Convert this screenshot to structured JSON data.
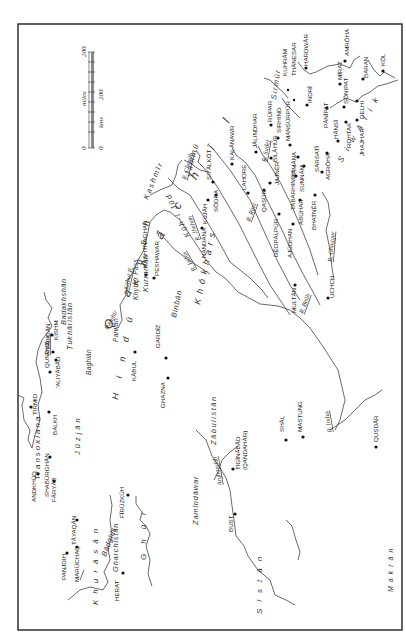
{
  "map": {
    "orientation": "rotated 90deg counter-clockwise (north to the left)",
    "scale_bar": {
      "miles_label": "miles",
      "kms_label": "kms",
      "miles_min": "0",
      "miles_max": "200",
      "kms_min": "0",
      "kms_max": "200"
    },
    "regions": [
      {
        "name": "Transoxiana"
      },
      {
        "name": "Badakhshān"
      },
      {
        "name": "Ṭukhāristān"
      },
      {
        "name": "Baghlān"
      },
      {
        "name": "Parwān"
      },
      {
        "name": "Panjhīr"
      },
      {
        "name": "Jūzjān"
      },
      {
        "name": "Khurāsān"
      },
      {
        "name": "Bādghīs"
      },
      {
        "name": "Gharchistān"
      },
      {
        "name": "Ghūr"
      },
      {
        "name": "Hindū Kush"
      },
      {
        "name": "Qarāchīl"
      },
      {
        "name": "Kashmīr"
      },
      {
        "name": "Jammū"
      },
      {
        "name": "Khōkhars"
      },
      {
        "name": "Kūh-i Jūd"
      },
      {
        "name": "Binbān"
      },
      {
        "name": "Kurramān"
      },
      {
        "name": "Khyber Pass"
      },
      {
        "name": "Zamīndāwar"
      },
      {
        "name": "Zābulistān"
      },
      {
        "name": "Sīstān"
      },
      {
        "name": "Makrān"
      },
      {
        "name": "Sirmūr"
      },
      {
        "name": "Siwālik"
      }
    ],
    "rivers": [
      {
        "name": "R. Oxus"
      },
      {
        "name": "Kābul R."
      },
      {
        "name": "R. Indus"
      },
      {
        "name": "R. Jhelum"
      },
      {
        "name": "R. Chenāb"
      },
      {
        "name": "R. Rāvī"
      },
      {
        "name": "R. Beāh"
      },
      {
        "name": "R. Sutlej"
      },
      {
        "name": "R. Ghaggar"
      },
      {
        "name": "Arghandāb"
      },
      {
        "name": "Panjnad"
      }
    ],
    "towns": [
      {
        "name": "TIRMID"
      },
      {
        "name": "QUNDUZ"
      },
      {
        "name": "ṬĀLIQĀN"
      },
      {
        "name": "KISHM"
      },
      {
        "name": "'ALIYĀBĀD"
      },
      {
        "name": "BALKH"
      },
      {
        "name": "ANDKHŪD"
      },
      {
        "name": "SHABŪRGHĀN"
      },
      {
        "name": "FĀRYĀB"
      },
      {
        "name": "TĀYAQĀN"
      },
      {
        "name": "PANJDIH"
      },
      {
        "name": "MARŪCHAQ"
      },
      {
        "name": "HERAT"
      },
      {
        "name": "FĪRŪZKŪH"
      },
      {
        "name": "KĀBUL"
      },
      {
        "name": "GARDĪZ"
      },
      {
        "name": "GHAZNA"
      },
      {
        "name": "HASHTNAGHAR"
      },
      {
        "name": "PESHAWAR"
      },
      {
        "name": "NANDANA"
      },
      {
        "name": "KŪJĀH"
      },
      {
        "name": "SŌDRA"
      },
      {
        "name": "SIYĀLKŌT"
      },
      {
        "name": "KALĀNAWR"
      },
      {
        "name": "LAHORE"
      },
      {
        "name": "JĀLINDHAR"
      },
      {
        "name": "QAṢŪR"
      },
      {
        "name": "DĒOPĀLPŪR"
      },
      {
        "name": "AJŪDHAN"
      },
      {
        "name": "MULTĀN"
      },
      {
        "name": "UCHCH"
      },
      {
        "name": "JAJNĒR"
      },
      {
        "name": "BILĀHŪR"
      },
      {
        "name": "RŪPAR"
      },
      {
        "name": "SIRHIND"
      },
      {
        "name": "MANṢŪRPŪR"
      },
      {
        "name": "SĀMĀNA"
      },
      {
        "name": "SUNNĀM"
      },
      {
        "name": "TABARHINDH"
      },
      {
        "name": "ABŪHAR"
      },
      {
        "name": "BHATNĒR"
      },
      {
        "name": "SARSATĪ"
      },
      {
        "name": "AGRŌHA"
      },
      {
        "name": "KUHRĀM"
      },
      {
        "name": "THĀNESAR"
      },
      {
        "name": "HARDWĀR"
      },
      {
        "name": "INDRĪ"
      },
      {
        "name": "PĀNĪPAT"
      },
      {
        "name": "HĀNSĪ"
      },
      {
        "name": "ROHTAK"
      },
      {
        "name": "JHAJHAR"
      },
      {
        "name": "SŌNIPAT"
      },
      {
        "name": "DELHI"
      },
      {
        "name": "MĪRAT"
      },
      {
        "name": "BARAN"
      },
      {
        "name": "KŌL"
      },
      {
        "name": "AMRŌHA"
      },
      {
        "name": "BUST"
      },
      {
        "name": "TIGĪNĀBĀD"
      },
      {
        "name": "(QANDAHĀR)"
      },
      {
        "name": "SHĀL"
      },
      {
        "name": "MASTUNG"
      },
      {
        "name": "QUṢDĀR"
      }
    ]
  }
}
